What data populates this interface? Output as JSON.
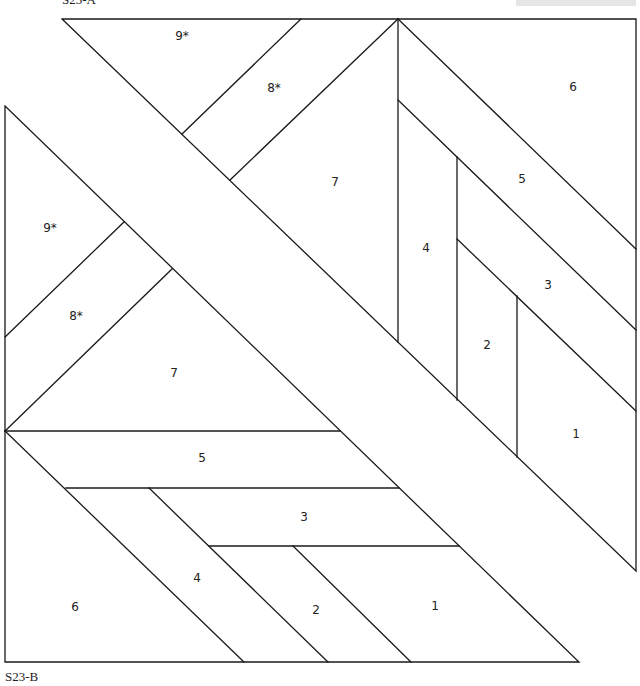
{
  "diagram": {
    "sections": [
      {
        "id": "A",
        "caption": "S23-A",
        "pieces": [
          {
            "label": "9*"
          },
          {
            "label": "8*"
          },
          {
            "label": "7"
          },
          {
            "label": "6"
          },
          {
            "label": "5"
          },
          {
            "label": "4"
          },
          {
            "label": "3"
          },
          {
            "label": "2"
          },
          {
            "label": "1"
          }
        ]
      },
      {
        "id": "B",
        "caption": "S23-B",
        "pieces": [
          {
            "label": "9*"
          },
          {
            "label": "8*"
          },
          {
            "label": "7"
          },
          {
            "label": "5"
          },
          {
            "label": "3"
          },
          {
            "label": "4"
          },
          {
            "label": "2"
          },
          {
            "label": "1"
          },
          {
            "label": "6"
          }
        ]
      }
    ],
    "colors": {
      "line": "#1a1a1a",
      "background": "#ffffff",
      "topbar": "#e6e6e6"
    }
  }
}
